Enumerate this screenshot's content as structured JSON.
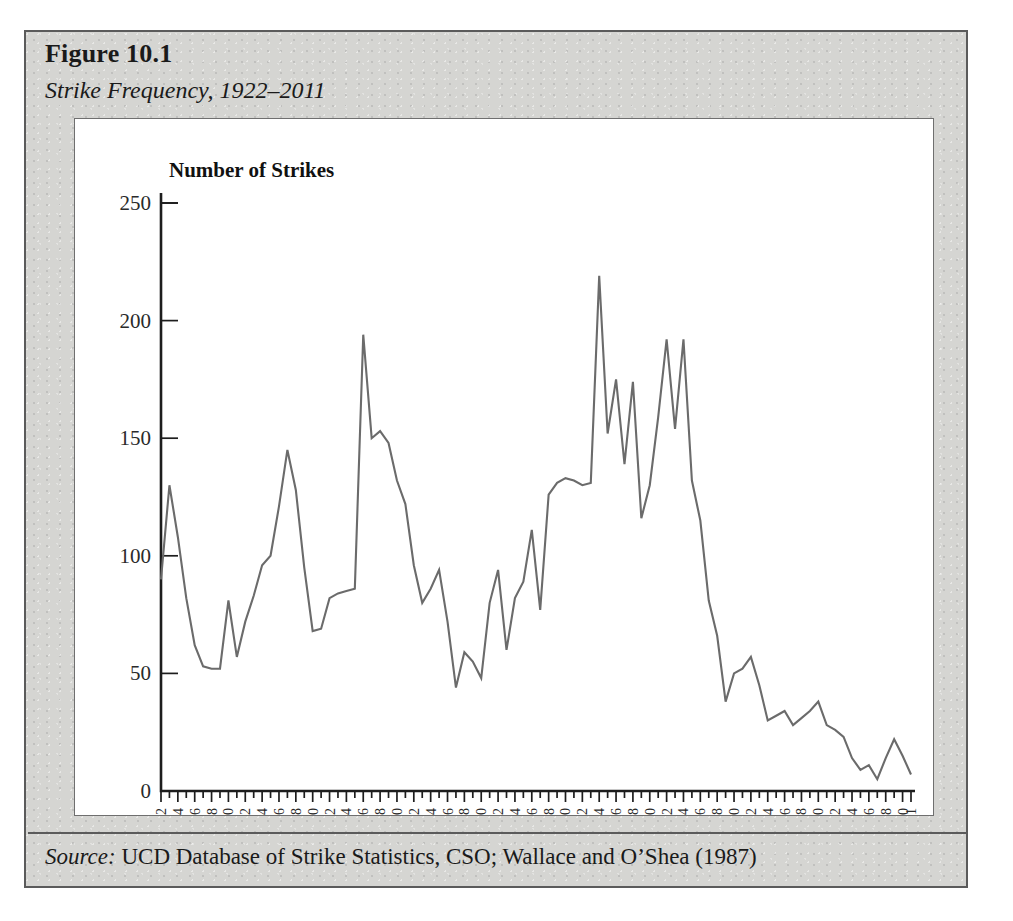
{
  "figure": {
    "number_label": "Figure 10.1",
    "caption": "Strike Frequency, 1922–2011",
    "source_label": "Source:",
    "source_text": " UCD Database of Strike Statistics, CSO; Wallace and O’Shea (1987)"
  },
  "colors": {
    "panel_background": "#d5d5d2",
    "plot_background": "#ffffff",
    "frame": "#5b5b5b",
    "line": "#6b6b6b",
    "axis": "#1d1d1d",
    "text": "#1a1a1a"
  },
  "chart_data": {
    "type": "line",
    "title": "Number of Strikes",
    "xlabel": "Year",
    "ylabel": "Number of Strikes",
    "ylim": [
      0,
      250
    ],
    "ytick_values": [
      0,
      50,
      100,
      150,
      200,
      250
    ],
    "ytick_labels": [
      "0",
      "50",
      "100",
      "150",
      "200",
      "250"
    ],
    "xlim": [
      1922,
      2011
    ],
    "xtick_labels": [
      "1922",
      "1924",
      "1926",
      "1928",
      "1930",
      "1932",
      "1934",
      "1936",
      "1938",
      "1940",
      "1942",
      "1944",
      "1946",
      "1948",
      "1950",
      "1952",
      "1954",
      "1956",
      "1958",
      "1960",
      "1962",
      "1964",
      "1966",
      "1968",
      "1970",
      "1972",
      "1974",
      "1976",
      "1978",
      "1980",
      "1982",
      "1984",
      "1986",
      "1988",
      "1990",
      "1992",
      "1994",
      "1996",
      "1998",
      "2000",
      "2002",
      "2004",
      "2006",
      "2008",
      "2010",
      "2011"
    ],
    "xtick_label_rotation": -90,
    "grid": false,
    "legend": false,
    "x": [
      1922,
      1923,
      1924,
      1925,
      1926,
      1927,
      1928,
      1929,
      1930,
      1931,
      1932,
      1933,
      1934,
      1935,
      1936,
      1937,
      1938,
      1939,
      1940,
      1941,
      1942,
      1943,
      1944,
      1945,
      1946,
      1947,
      1948,
      1949,
      1950,
      1951,
      1952,
      1953,
      1954,
      1955,
      1956,
      1957,
      1958,
      1959,
      1960,
      1961,
      1962,
      1963,
      1964,
      1965,
      1966,
      1967,
      1968,
      1969,
      1970,
      1971,
      1972,
      1973,
      1974,
      1975,
      1976,
      1977,
      1978,
      1979,
      1980,
      1981,
      1982,
      1983,
      1984,
      1985,
      1986,
      1987,
      1988,
      1989,
      1990,
      1991,
      1992,
      1993,
      1994,
      1995,
      1996,
      1997,
      1998,
      1999,
      2000,
      2001,
      2002,
      2003,
      2004,
      2005,
      2006,
      2007,
      2008,
      2009,
      2010,
      2011
    ],
    "values": [
      90,
      130,
      108,
      82,
      62,
      53,
      52,
      52,
      81,
      57,
      72,
      83,
      96,
      100,
      121,
      145,
      128,
      95,
      68,
      69,
      82,
      84,
      85,
      86,
      194,
      150,
      153,
      148,
      132,
      122,
      96,
      80,
      86,
      94,
      72,
      44,
      59,
      55,
      48,
      80,
      94,
      60,
      82,
      89,
      111,
      77,
      126,
      131,
      133,
      132,
      130,
      131,
      219,
      152,
      175,
      139,
      174,
      116,
      130,
      159,
      192,
      154,
      192,
      132,
      115,
      81,
      66,
      38,
      50,
      52,
      57,
      45,
      30,
      32,
      34,
      28,
      31,
      34,
      38,
      28,
      26,
      23,
      14,
      9,
      11,
      5,
      14,
      22,
      15,
      7
    ],
    "series_name": "Number of Strikes",
    "annotations": []
  }
}
